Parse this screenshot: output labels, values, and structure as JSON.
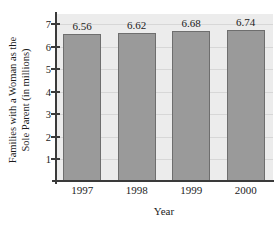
{
  "chart_data": {
    "type": "bar",
    "title": "",
    "categories": [
      "1997",
      "1998",
      "1999",
      "2000"
    ],
    "values": [
      6.56,
      6.62,
      6.68,
      6.74
    ],
    "value_labels": [
      "6.56",
      "6.62",
      "6.68",
      "6.74"
    ],
    "xlabel": "Year",
    "ylabel": "Families with a Woman as the Sole Parent (in millions)",
    "ylabel_line1": "Families with a Woman as the",
    "ylabel_line2": "Sole Parent (in millions)",
    "yticks": [
      1,
      2,
      3,
      4,
      5,
      6,
      7
    ],
    "ytick_labels": [
      "1",
      "2",
      "3",
      "4",
      "5",
      "6",
      "7"
    ],
    "ylim": [
      0,
      7.45
    ],
    "grid": true,
    "legend": false,
    "colors": {
      "bar_fill": "#9a9a9a",
      "bar_edge": "#6e6e6e",
      "plot_background": "#ececec",
      "page_background": "#ffffff",
      "axis": "#3a3a3a",
      "gridline": "#d7d7d7",
      "text": "#1c1c1c"
    }
  }
}
